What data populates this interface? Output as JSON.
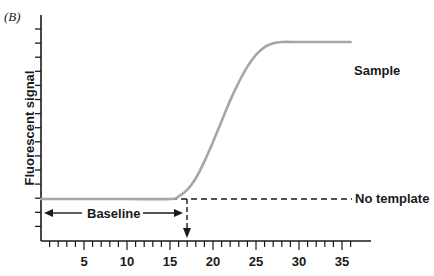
{
  "panel_label": "(B)",
  "chart_data": {
    "type": "line",
    "title": "",
    "xlabel": "",
    "ylabel": "Fluorescent signal",
    "xlim": [
      0,
      38
    ],
    "x_ticks": [
      5,
      10,
      15,
      20,
      25,
      30,
      35
    ],
    "x_minor_tick_step": 1,
    "y_ticks_count": 15,
    "y_tick_labels": [],
    "grid": false,
    "series": [
      {
        "name": "Sample",
        "color": "#a6a6a6",
        "x": [
          0,
          5,
          10,
          15,
          16,
          17,
          18,
          19,
          20,
          21,
          22,
          23,
          24,
          25,
          26,
          27,
          28,
          30,
          33,
          36
        ],
        "y": [
          0,
          0,
          0,
          0,
          0.2,
          0.7,
          1.6,
          2.9,
          4.4,
          6.0,
          7.6,
          9.0,
          10.2,
          11.1,
          11.7,
          12.0,
          12.1,
          12.1,
          12.1,
          12.1
        ]
      },
      {
        "name": "No template",
        "color": "#1a1a1a",
        "style": "dashed",
        "x": [
          0,
          36
        ],
        "y": [
          0,
          0
        ]
      }
    ],
    "annotations": [
      {
        "text": "Baseline",
        "type": "double-arrow",
        "x_from": 0,
        "x_to": 16
      },
      {
        "text": "",
        "type": "threshold-cycle-arrow",
        "x": 17,
        "style": "dashed",
        "direction": "down"
      }
    ],
    "legend": "inline labels at line ends (right)"
  }
}
